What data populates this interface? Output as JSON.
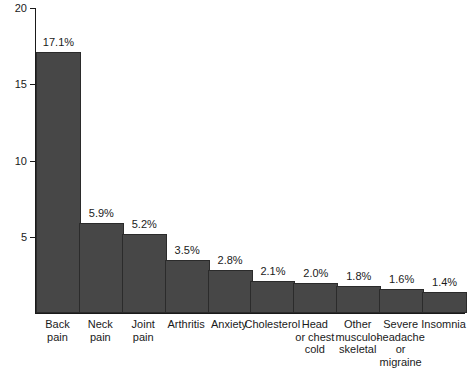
{
  "chart_data": {
    "type": "bar",
    "title": "",
    "subtitle": "",
    "xlabel": "",
    "ylabel": "",
    "ylim": [
      0,
      20
    ],
    "yticks": [
      5,
      10,
      15,
      20
    ],
    "ytick_labels": [
      "5",
      "10",
      "15",
      "20"
    ],
    "grid": false,
    "legend": false,
    "legend_position": "none",
    "orientation": "vertical",
    "bar_color": "#474747",
    "bar_edge_color": "#2b2b2b",
    "background_color": "#ffffff",
    "axis_color": "#1a1a1a",
    "text_color": "#1a1a1a",
    "value_label_suffix": "%",
    "categories": [
      "Back\npain",
      "Neck\npain",
      "Joint\npain",
      "Arthritis",
      "Anxiety",
      "Cholesterol",
      "Head\nor chest\ncold",
      "Other\nmusculo-\nskeletal",
      "Severe\nheadache\nor migraine",
      "Insomnia"
    ],
    "values": [
      17.1,
      5.9,
      5.2,
      3.5,
      2.8,
      2.1,
      2.0,
      1.8,
      1.6,
      1.4
    ],
    "value_labels": [
      "17.1%",
      "5.9%",
      "5.2%",
      "3.5%",
      "2.8%",
      "2.1%",
      "2.0%",
      "1.8%",
      "1.6%",
      "1.4%"
    ]
  }
}
